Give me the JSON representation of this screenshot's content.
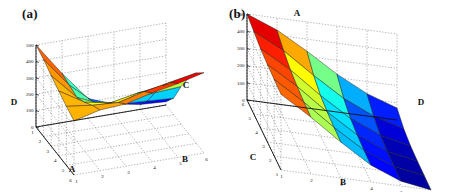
{
  "figure": {
    "background": "#ffffff",
    "panels": [
      {
        "id": "a",
        "label": "(a)",
        "label_pos": [
          22,
          6
        ],
        "chart_ref": 0
      },
      {
        "id": "b",
        "label": "(b)",
        "label_pos": [
          4,
          6
        ],
        "chart_ref": 1
      }
    ]
  },
  "chart_data": [
    {
      "type": "surface",
      "panel": "a",
      "title": "(a)",
      "xlabel": "A",
      "ylabel": "B",
      "zlabel": "D",
      "annotation_label": "C",
      "x": [
        1,
        2,
        3,
        4,
        5,
        6
      ],
      "y": [
        1,
        2,
        3,
        4,
        5,
        6
      ],
      "xticks": [
        "1",
        "2",
        "3",
        "4",
        "5",
        "6"
      ],
      "yticks": [
        "1",
        "2",
        "3",
        "4",
        "5",
        "6"
      ],
      "zticks": [
        "0",
        "100",
        "200",
        "300",
        "400",
        "500"
      ],
      "zlim": [
        0,
        500
      ],
      "grid": true,
      "colormap": "jet",
      "cmap_stops": [
        "#00007f",
        "#0000ff",
        "#007fff",
        "#00ffff",
        "#7fff7f",
        "#ffff00",
        "#ff7f00",
        "#ff0000",
        "#7f0000"
      ],
      "view": {
        "azimuth": -37.5,
        "elevation": 22
      },
      "z": [
        [
          500,
          470,
          430,
          395,
          360,
          330
        ],
        [
          300,
          285,
          270,
          300,
          340,
          370
        ],
        [
          120,
          150,
          200,
          270,
          330,
          380
        ],
        [
          60,
          120,
          210,
          300,
          370,
          420
        ],
        [
          30,
          110,
          220,
          320,
          400,
          450
        ],
        [
          20,
          100,
          230,
          340,
          430,
          490
        ]
      ]
    },
    {
      "type": "surface",
      "panel": "b",
      "title": "(b)",
      "xlabel": "C",
      "ylabel": "B",
      "zlabel": "D",
      "annotation_label": "A",
      "x": [
        1,
        2,
        3,
        4,
        5,
        6
      ],
      "y": [
        1,
        2,
        3,
        4,
        5,
        6
      ],
      "xticks": [
        "6",
        "5",
        "4",
        "3",
        "2",
        "1"
      ],
      "yticks": [
        "1",
        "2",
        "3",
        "4",
        "5",
        "6"
      ],
      "zticks": [
        "0",
        "100",
        "200",
        "300",
        "400",
        "500"
      ],
      "zlim": [
        0,
        500
      ],
      "grid": true,
      "colormap": "jet",
      "cmap_stops": [
        "#00007f",
        "#0000ff",
        "#007fff",
        "#00ffff",
        "#7fff7f",
        "#ffff00",
        "#ff7f00",
        "#ff0000",
        "#7f0000"
      ],
      "view": {
        "azimuth": -37.5,
        "elevation": 22
      },
      "z": [
        [
          500,
          480,
          460,
          450,
          445,
          440
        ],
        [
          430,
          390,
          360,
          345,
          335,
          330
        ],
        [
          330,
          270,
          235,
          220,
          212,
          208
        ],
        [
          220,
          160,
          125,
          110,
          102,
          98
        ],
        [
          130,
          80,
          50,
          38,
          32,
          28
        ],
        [
          70,
          30,
          12,
          6,
          3,
          0
        ]
      ]
    }
  ]
}
